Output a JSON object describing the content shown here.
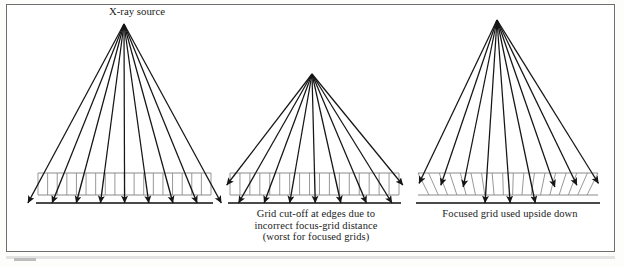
{
  "figure": {
    "source_label": "X-ray source",
    "captions": {
      "middle": "Grid cut-off at edges due to\nincorrect focus-grid distance\n(worst for focused grids)",
      "right": "Focused grid used upside down"
    }
  },
  "chart_data": {
    "type": "diagram",
    "title": "X-ray source",
    "colors": {
      "ray": "#151515",
      "grid_line": "#8c8c8c",
      "film": "#4a4a4a",
      "border": "#6e6e6e",
      "text": "#1b1b1b"
    },
    "panels": [
      {
        "name": "parallel-grid",
        "caption": "",
        "apex": [
          124,
          24
        ],
        "grid": {
          "x0": 38,
          "x1": 211,
          "top": 173,
          "bottom": 195,
          "septa": 18,
          "septa_tilt": "vertical"
        },
        "film_y": 203,
        "rays": 9,
        "ray_outcome": "all rays transmitted to film"
      },
      {
        "name": "grid-cutoff-at-edges",
        "caption": "Grid cut-off at edges due to incorrect focus-grid distance (worst for focused grids)",
        "apex": [
          312,
          74
        ],
        "grid": {
          "x0": 230,
          "x1": 399,
          "top": 173,
          "bottom": 195,
          "septa": 17,
          "septa_tilt": "vertical"
        },
        "film_y": 203,
        "rays": 9,
        "ray_outcome": "edge rays absorbed inside grid, central rays reach film"
      },
      {
        "name": "focused-grid-upside-down",
        "caption": "Focused grid used upside down",
        "apex": [
          497,
          20
        ],
        "grid": {
          "x0": 418,
          "x1": 598,
          "top": 173,
          "bottom": 195,
          "septa": 17,
          "septa_tilt": "inverted-focus"
        },
        "film_y": 203,
        "rays": 9,
        "ray_outcome": "only central rays reach film, peripheral rays absorbed"
      }
    ]
  }
}
